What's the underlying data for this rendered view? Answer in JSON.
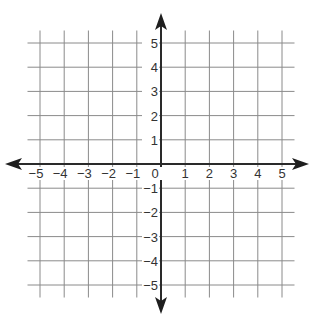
{
  "chart_data": {
    "type": "coordinate-grid",
    "title": "",
    "xlabel": "",
    "ylabel": "",
    "xlim": [
      -5,
      5
    ],
    "ylim": [
      -5,
      5
    ],
    "grid": true,
    "legend": null,
    "x_ticks": [
      -5,
      -4,
      -3,
      -2,
      -1,
      0,
      1,
      2,
      3,
      4,
      5
    ],
    "y_ticks": [
      -5,
      -4,
      -3,
      -2,
      -1,
      1,
      2,
      3,
      4,
      5
    ],
    "x_tick_labels": [
      "−5",
      "−4",
      "−3",
      "−2",
      "−1",
      "0",
      "1",
      "2",
      "3",
      "4",
      "5"
    ],
    "y_tick_labels": [
      "−5",
      "−4",
      "−3",
      "−2",
      "−1",
      "1",
      "2",
      "3",
      "4",
      "5"
    ],
    "axes_arrows": [
      "left",
      "right",
      "up",
      "down"
    ],
    "series": []
  },
  "layout": {
    "origin_x": 161,
    "origin_y": 164,
    "unit_px": 24.2,
    "grid_overhang_px": 12.5,
    "axis_x_left": 5,
    "axis_x_right": 309,
    "axis_y_top": 13,
    "axis_y_bottom": 314
  },
  "colors": {
    "grid": "#8a8a8a",
    "axis": "#2a2a2a",
    "text": "#333333",
    "background": "#ffffff"
  }
}
